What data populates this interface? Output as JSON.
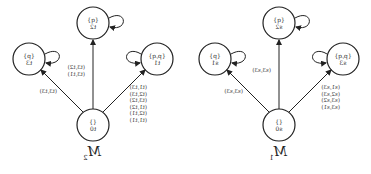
{
  "figure": {
    "orientation": "mirrored-horizontally",
    "panels": [
      {
        "caption": "M",
        "caption_sub": "1",
        "nodes": {
          "center": {
            "props": "{}",
            "state": "s0"
          },
          "left": {
            "props": "{p,q}",
            "state": "s3"
          },
          "top": {
            "props": "{q}",
            "state": "s2"
          },
          "right": {
            "props": "{p}",
            "state": "s1"
          }
        },
        "edge_labels": {
          "left": [
            "(s1,s3)",
            "(s2,s3)",
            "(s3,s2)",
            "(s3,s1)"
          ],
          "top": [
            "(s3,s3)"
          ],
          "right": [
            "(s3,s3)"
          ]
        }
      },
      {
        "caption": "M",
        "caption_sub": "2",
        "nodes": {
          "center": {
            "props": "{}",
            "state": "t0"
          },
          "left": {
            "props": "{p,q}",
            "state": "t1"
          },
          "top": {
            "props": "{q}",
            "state": "t2"
          },
          "right": {
            "props": "{p}",
            "state": "t3"
          }
        },
        "edge_labels": {
          "left": [
            "(t1,t3)",
            "(t2,t3)",
            "(t3,t2)",
            "(t1,t2)",
            "(t2,t1)",
            "(t1,t1)"
          ],
          "top": [
            "(t3,t2)",
            "(t3,t1)"
          ],
          "right": [
            "(t3,t3)"
          ]
        }
      }
    ]
  }
}
